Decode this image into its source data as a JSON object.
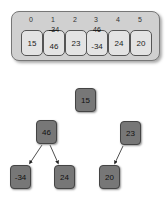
{
  "array": {
    "indices": [
      "0",
      "1",
      "2",
      "3",
      "4",
      "5"
    ],
    "cells": [
      "15",
      "46",
      "23",
      "-34",
      "24",
      "20"
    ],
    "overwritten": [
      {
        "index": 1,
        "old": "-34"
      },
      {
        "index": 3,
        "old": "46"
      }
    ]
  },
  "tree": {
    "nodes": [
      {
        "id": "root",
        "value": "15"
      },
      {
        "id": "left",
        "value": "46"
      },
      {
        "id": "right",
        "value": "23"
      },
      {
        "id": "left-left",
        "value": "-34"
      },
      {
        "id": "left-right",
        "value": "24"
      },
      {
        "id": "right-left",
        "value": "20"
      }
    ]
  },
  "colors": {
    "panel": "#d0d0d0",
    "cell": "#e3e3e3",
    "node": "#777777"
  }
}
